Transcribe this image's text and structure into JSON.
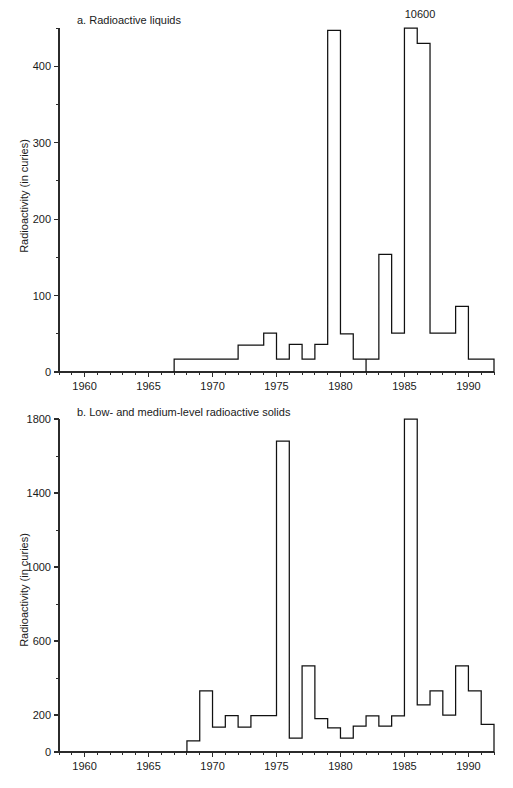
{
  "page": {
    "background_color": "#ffffff",
    "ink_color": "#111111",
    "width": 513,
    "height": 788
  },
  "chart_data": [
    {
      "type": "area",
      "panel_id": "a",
      "title": "a. Radioactive liquids",
      "xlabel": "",
      "ylabel": "Radioactivity (in curies)",
      "xlim": [
        1958,
        1992
      ],
      "ylim": [
        0,
        450
      ],
      "grid": false,
      "legend": null,
      "x_major_ticks": [
        1960,
        1965,
        1970,
        1975,
        1980,
        1985,
        1990
      ],
      "x_major_tick_labels": [
        "1960",
        "1965",
        "1970",
        "1975",
        "1980",
        "1985",
        "1990"
      ],
      "x_minor_tick_step": 1,
      "y_major_ticks": [
        0,
        100,
        200,
        300,
        400
      ],
      "y_major_tick_labels": [
        "0",
        "100",
        "200",
        "300",
        "400"
      ],
      "y_minor_tick_step": 50,
      "annotations": [
        {
          "text": "10600",
          "x": 1985,
          "y": 450,
          "note": "value of 1985 bar extends beyond axis"
        }
      ],
      "x": [
        1967,
        1968,
        1969,
        1970,
        1971,
        1972,
        1973,
        1974,
        1975,
        1976,
        1977,
        1978,
        1979,
        1980,
        1981,
        1982,
        1983,
        1984,
        1985,
        1986,
        1987,
        1988,
        1989,
        1990,
        1991
      ],
      "values": [
        17,
        17,
        17,
        17,
        17,
        35,
        35,
        51,
        17,
        36,
        17,
        36,
        447,
        50,
        17,
        17,
        154,
        51,
        10600,
        430,
        51,
        51,
        86,
        17,
        17
      ],
      "gap_years": [
        1981.5
      ]
    },
    {
      "type": "area",
      "panel_id": "b",
      "title": "b. Low- and medium-level radioactive solids",
      "xlabel": "",
      "ylabel": "Radioactivity (in curies)",
      "xlim": [
        1958,
        1992
      ],
      "ylim": [
        0,
        1800
      ],
      "grid": false,
      "legend": null,
      "x_major_ticks": [
        1960,
        1965,
        1970,
        1975,
        1980,
        1985,
        1990
      ],
      "x_major_tick_labels": [
        "1960",
        "1965",
        "1970",
        "1975",
        "1980",
        "1985",
        "1990"
      ],
      "x_minor_tick_step": 1,
      "y_major_ticks": [
        0,
        200,
        600,
        1000,
        1400,
        1800
      ],
      "y_major_tick_labels": [
        "0",
        "200",
        "600",
        "1000",
        "1400",
        "1800"
      ],
      "y_minor_tick_step": 200,
      "annotations": [],
      "x": [
        1968,
        1969,
        1970,
        1971,
        1972,
        1973,
        1974,
        1975,
        1976,
        1977,
        1978,
        1979,
        1980,
        1981,
        1982,
        1983,
        1984,
        1985,
        1986,
        1987,
        1988,
        1989,
        1990,
        1991
      ],
      "values": [
        60,
        330,
        135,
        197,
        135,
        197,
        197,
        1680,
        75,
        465,
        180,
        130,
        75,
        140,
        195,
        140,
        195,
        1810,
        255,
        330,
        200,
        465,
        330,
        150
      ],
      "tail_value": 75
    }
  ]
}
